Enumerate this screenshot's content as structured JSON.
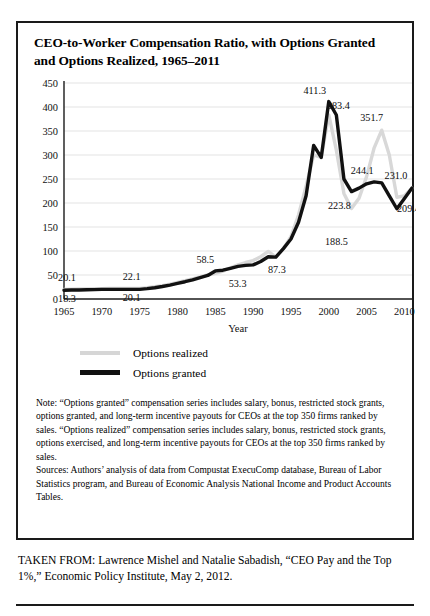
{
  "figure": {
    "title": "CEO-to-Worker Compensation Ratio, with Options Granted and Options Realized, 1965–2011",
    "note": "Note: “Options granted” compensation series includes salary, bonus, restricted stock grants, options granted, and long-term incentive payouts for CEOs at the top 350 firms ranked by sales. “Options realized” compensation series includes salary, bonus, restricted stock grants, options exercised, and long-term incentive payouts for CEOs at the top 350 firms ranked by sales.",
    "sources": "Sources: Authors’ analysis of data from Compustat ExecuComp database, Bureau of Labor Statistics program, and Bureau of Economic Analysis National Income and Product Accounts Tables.",
    "taken_from": "TAKEN FROM: Lawrence Mishel and Natalie Sabadish, “CEO Pay and the Top 1%,” Economic Policy Institute, May 2, 2012."
  },
  "colors": {
    "granted": "#111111",
    "realized": "#d8d8d8",
    "gridline": "#e3e3e3",
    "axis": "#1a1a1a",
    "border": "#1a1a1a",
    "background": "#ffffff"
  },
  "chart_data": {
    "type": "line",
    "title": "CEO-to-Worker Compensation Ratio, with Options Granted and Options Realized, 1965–2011",
    "xlabel": "Year",
    "ylabel": "",
    "xlim": [
      1965,
      2011
    ],
    "ylim": [
      0,
      450
    ],
    "grid": true,
    "legend_position": "below-left",
    "yticks": [
      0,
      50,
      100,
      150,
      200,
      250,
      300,
      350,
      400,
      450
    ],
    "xticks": [
      1965,
      1970,
      1975,
      1980,
      1985,
      1990,
      1995,
      2000,
      2005,
      2010
    ],
    "series": [
      {
        "name": "Options realized",
        "color": "#d8d8d8",
        "x": [
          1965,
          1966,
          1967,
          1968,
          1969,
          1970,
          1971,
          1972,
          1973,
          1974,
          1975,
          1976,
          1977,
          1978,
          1979,
          1980,
          1981,
          1982,
          1983,
          1984,
          1985,
          1986,
          1987,
          1988,
          1989,
          1990,
          1991,
          1992,
          1993,
          1994,
          1995,
          1996,
          1997,
          1998,
          1999,
          2000,
          2001,
          2002,
          2003,
          2004,
          2005,
          2006,
          2007,
          2008,
          2009,
          2010,
          2011
        ],
        "values": [
          20.1,
          20.4,
          20.8,
          21.1,
          21.4,
          21.6,
          21.8,
          22.0,
          22.1,
          22.1,
          22.1,
          23.5,
          25.5,
          28.0,
          31.0,
          34.5,
          38.0,
          42.0,
          46.0,
          50.0,
          53.3,
          58.0,
          65.0,
          71.0,
          76.0,
          80.0,
          88.0,
          99.0,
          87.3,
          105.0,
          130.0,
          175.0,
          235.0,
          300.0,
          295.0,
          383.4,
          310.0,
          220.0,
          188.5,
          210.0,
          255.0,
          315.0,
          351.7,
          300.0,
          212.0,
          215.0,
          231.0
        ]
      },
      {
        "name": "Options granted",
        "color": "#111111",
        "x": [
          1965,
          1966,
          1967,
          1968,
          1969,
          1970,
          1971,
          1972,
          1973,
          1974,
          1975,
          1976,
          1977,
          1978,
          1979,
          1980,
          1981,
          1982,
          1983,
          1984,
          1985,
          1986,
          1987,
          1988,
          1989,
          1990,
          1991,
          1992,
          1993,
          1994,
          1995,
          1996,
          1997,
          1998,
          1999,
          2000,
          2001,
          2002,
          2003,
          2004,
          2005,
          2006,
          2007,
          2008,
          2009,
          2010,
          2011
        ],
        "values": [
          18.3,
          18.6,
          18.9,
          19.2,
          19.5,
          20.1,
          20.1,
          20.1,
          20.1,
          20.1,
          20.1,
          21.5,
          23.5,
          26.0,
          29.0,
          32.5,
          36.0,
          40.0,
          44.5,
          49.0,
          58.5,
          60.0,
          64.0,
          68.0,
          70.0,
          71.0,
          78.0,
          88.0,
          87.3,
          105.0,
          125.0,
          160.0,
          215.0,
          320.0,
          295.0,
          411.3,
          383.4,
          250.0,
          223.8,
          231.0,
          240.0,
          244.1,
          242.0,
          215.0,
          188.0,
          209.4,
          231.0
        ]
      }
    ],
    "point_labels": [
      {
        "text": "20.1",
        "year": 1965,
        "value": 20.1,
        "series": "Options realized",
        "dx": 3,
        "dy": -8
      },
      {
        "text": "18.3",
        "year": 1965,
        "value": 18.3,
        "series": "Options granted",
        "dx": 3,
        "dy": 12
      },
      {
        "text": "22.1",
        "year": 1975,
        "value": 22.1,
        "series": "Options realized",
        "dx": -8,
        "dy": -8
      },
      {
        "text": "20.1",
        "year": 1975,
        "value": 20.1,
        "series": "Options granted",
        "dx": -8,
        "dy": 12
      },
      {
        "text": "58.5",
        "year": 1985,
        "value": 58.5,
        "series": "Options granted",
        "dx": -10,
        "dy": -8
      },
      {
        "text": "53.3",
        "year": 1989,
        "value": 53.3,
        "series": "Options realized",
        "dx": -8,
        "dy": 14
      },
      {
        "text": "87.3",
        "year": 1993,
        "value": 87.3,
        "series": "Options granted",
        "dx": 1,
        "dy": 16
      },
      {
        "text": "411.3",
        "year": 2000,
        "value": 411.3,
        "series": "Options granted",
        "dx": -14,
        "dy": -8
      },
      {
        "text": "383.4",
        "year": 2001,
        "value": 383.4,
        "series": "Options granted",
        "dx": 2,
        "dy": -6
      },
      {
        "text": "351.7",
        "year": 2007,
        "value": 351.7,
        "series": "Options realized",
        "dx": -10,
        "dy": -9
      },
      {
        "text": "223.8",
        "year": 2003,
        "value": 223.8,
        "series": "Options granted",
        "dx": -12,
        "dy": 17
      },
      {
        "text": "188.5",
        "year": 2003,
        "value": 188.5,
        "series": "Options realized",
        "dx": -15,
        "dy": 36
      },
      {
        "text": "244.1",
        "year": 2006,
        "value": 244.1,
        "series": "Options granted",
        "dx": -12,
        "dy": -8
      },
      {
        "text": "231.0",
        "year": 2011,
        "value": 231.0,
        "series": "Options granted",
        "dx": -16,
        "dy": -9
      },
      {
        "text": "209.4",
        "year": 2010,
        "value": 209.4,
        "series": "Options granted",
        "dx": 4,
        "dy": 14
      }
    ]
  },
  "legend": {
    "items": [
      {
        "label": "Options realized",
        "key": "realized"
      },
      {
        "label": "Options granted",
        "key": "granted"
      }
    ]
  }
}
